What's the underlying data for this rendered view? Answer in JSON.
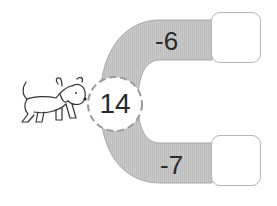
{
  "puzzle": {
    "start_value": "14",
    "top_branch": {
      "operation": "-6",
      "answer": ""
    },
    "bottom_branch": {
      "operation": "-7",
      "answer": ""
    }
  },
  "illustration": {
    "icon": "dog-icon"
  },
  "colors": {
    "band": "#c8c8c8",
    "band_edge": "#a9a9a9",
    "text": "#2a2a2a",
    "box_border": "#b5b5b5"
  }
}
